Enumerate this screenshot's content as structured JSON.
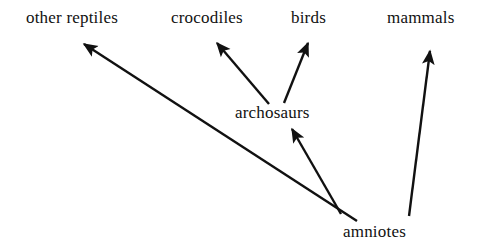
{
  "diagram": {
    "type": "cladogram",
    "title": "",
    "background_color": "#ffffff",
    "line_color": "#111111",
    "text_color": "#111111",
    "nodes": [
      {
        "id": "other_reptiles",
        "label": "other reptiles",
        "role": "terminal-taxon"
      },
      {
        "id": "crocodiles",
        "label": "crocodiles",
        "role": "terminal-taxon"
      },
      {
        "id": "birds",
        "label": "birds",
        "role": "terminal-taxon"
      },
      {
        "id": "mammals",
        "label": "mammals",
        "role": "terminal-taxon"
      },
      {
        "id": "archosaurs",
        "label": "archosaurs",
        "role": "internal-node"
      },
      {
        "id": "amniotes",
        "label": "amniotes",
        "role": "root-node"
      }
    ],
    "edges": [
      {
        "from": "amniotes",
        "to": "other_reptiles",
        "arrow": "arrowhead"
      },
      {
        "from": "amniotes",
        "to": "archosaurs",
        "arrow": "arrowhead"
      },
      {
        "from": "amniotes",
        "to": "mammals",
        "arrow": "arrowhead"
      },
      {
        "from": "archosaurs",
        "to": "crocodiles",
        "arrow": "arrowhead"
      },
      {
        "from": "archosaurs",
        "to": "birds",
        "arrow": "arrowhead"
      }
    ]
  }
}
